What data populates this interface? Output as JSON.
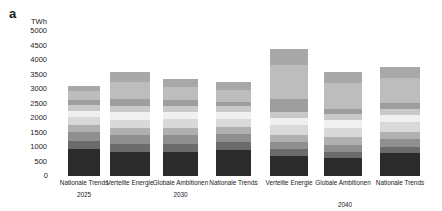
{
  "panel": {
    "letter": "a"
  },
  "axis": {
    "unit": "TWh",
    "ticks": [
      "0",
      "500",
      "1000",
      "1500",
      "2000",
      "2500",
      "3000",
      "3500",
      "4000",
      "4500",
      "5000"
    ],
    "zero_label": "0"
  },
  "groups": [
    {
      "year": "2025",
      "scenarios": [
        "Nationale Trends"
      ]
    },
    {
      "year": "2030",
      "scenarios": [
        "Verteilte Energie",
        "Globale Ambitionen",
        "Nationale Trends"
      ]
    },
    {
      "year": "2040",
      "scenarios": [
        "Verteilte Energie",
        "Globale\nAmbitionen",
        "Nationale Trends"
      ]
    }
  ],
  "colors": {
    "s1": "#2b2b2b",
    "s2": "#6b6b6b",
    "s3": "#8f8f8f",
    "s4": "#b0b0b0",
    "s5": "#d9d9d9",
    "s6": "#f0f0f0",
    "s7": "#c9c9c9",
    "s8": "#9e9e9e",
    "s9": "#bdbdbd",
    "s10": "#a8a8a8"
  },
  "chart_data": {
    "type": "bar",
    "title": "",
    "subtitle": "",
    "xlabel": "",
    "ylabel": "TWh",
    "ylim": [
      0,
      5000
    ],
    "ytick_step": 500,
    "grid": false,
    "legend": "none",
    "stacked": true,
    "categories": [
      "Nationale Trends 2025",
      "Verteilte Energie 2030",
      "Globale Ambitionen 2030",
      "Nationale Trends 2030",
      "Verteilte Energie 2040",
      "Globale Ambitionen 2040",
      "Nationale Trends 2040"
    ],
    "category_labels": [
      "Nationale Trends",
      "Verteilte Energie",
      "Globale Ambitionen",
      "Nationale Trends",
      "Verteilte Energie",
      "Globale Ambitionen",
      "Nationale Trends"
    ],
    "year_labels": [
      "2025",
      "2030",
      "2030",
      "2030",
      "2040",
      "2040",
      "2040"
    ],
    "totals": [
      3100,
      3600,
      3350,
      3250,
      4400,
      3600,
      3750
    ],
    "series": [
      {
        "name": "segment-1",
        "color": "#2b2b2b",
        "values": [
          940,
          820,
          820,
          900,
          700,
          620,
          780
        ]
      },
      {
        "name": "segment-2",
        "color": "#6b6b6b",
        "values": [
          260,
          280,
          300,
          260,
          220,
          200,
          230
        ]
      },
      {
        "name": "segment-3",
        "color": "#8f8f8f",
        "values": [
          330,
          300,
          300,
          290,
          250,
          260,
          270
        ]
      },
      {
        "name": "segment-4",
        "color": "#b0b0b0",
        "values": [
          230,
          250,
          250,
          240,
          250,
          250,
          250
        ]
      },
      {
        "name": "segment-5",
        "color": "#d9d9d9",
        "values": [
          270,
          300,
          300,
          280,
          330,
          330,
          320
        ]
      },
      {
        "name": "segment-6",
        "color": "#f0f0f0",
        "values": [
          220,
          260,
          250,
          230,
          260,
          260,
          260
        ]
      },
      {
        "name": "segment-7",
        "color": "#c9c9c9",
        "values": [
          200,
          210,
          210,
          200,
          210,
          210,
          210
        ]
      },
      {
        "name": "segment-8",
        "color": "#9e9e9e",
        "values": [
          160,
          230,
          180,
          160,
          430,
          200,
          190
        ]
      },
      {
        "name": "segment-9",
        "color": "#bdbdbd",
        "values": [
          330,
          600,
          450,
          400,
          1180,
          880,
          880
        ]
      },
      {
        "name": "segment-10",
        "color": "#a8a8a8",
        "values": [
          160,
          350,
          290,
          290,
          570,
          390,
          360
        ]
      }
    ]
  }
}
